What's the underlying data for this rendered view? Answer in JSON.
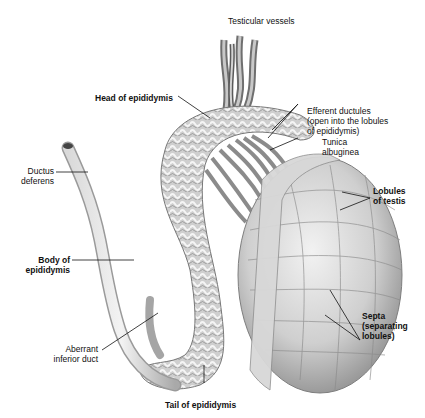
{
  "figure": {
    "labels": {
      "testicular_vessels": "Testicular vessels",
      "head_of_epididymis": "Head of epididymis",
      "efferent_ductules": "Efferent ductules\n(open into the lobules\nof epididymis)",
      "tunica_albuginea": "Tunica\nalbuginea",
      "lobules_of_testis": "Lobules\nof testis",
      "ductus_deferens": "Ductus\ndeferens",
      "body_of_epididymis": "Body of\nepididymis",
      "septa": "Septa\n(separating\nlobules)",
      "aberrant_inferior_duct": "Aberrant\ninferior duct",
      "tail_of_epididymis": "Tail of epididymis"
    },
    "colors": {
      "tissue_light": "#e6e6e6",
      "tissue_mid": "#bdbdbd",
      "tissue_dark": "#7a7a7a",
      "leader_line": "#111111"
    }
  }
}
